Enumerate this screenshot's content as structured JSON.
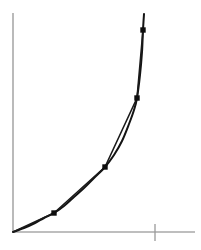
{
  "figure": {
    "width": 201,
    "height": 250,
    "background_color": "#ffffff"
  },
  "colors": {
    "axis": "#a9a9a9",
    "tick": "#9a9a9a",
    "curve": "#141414",
    "chord": "#1a1a1a",
    "marker": "#0d0d0d"
  },
  "axes": {
    "y_axis": {
      "label": "",
      "x": 13,
      "y_top": 13,
      "y_bottom": 232,
      "stroke_width": 1.6
    },
    "x_axis": {
      "label": "",
      "y": 232,
      "x_left": 13,
      "x_right": 195,
      "stroke_width": 1.6
    },
    "ticks": [
      {
        "name": "x-tick-1",
        "axis": "x",
        "x": 155,
        "y_top": 224,
        "y_bottom": 241,
        "label": ""
      }
    ]
  },
  "chart_data": {
    "type": "line",
    "title": "",
    "subtitle": "",
    "xlabel": "",
    "ylabel": "",
    "grid": false,
    "legend": null,
    "xlim": [
      13,
      195
    ],
    "ylim": [
      13,
      232
    ],
    "axis_note": "unlabeled schematic axes; values are pixel coordinates of the figure",
    "series": [
      {
        "name": "smooth-curve",
        "description": "smooth convex increasing curve drawn from the origin upward, continuing past the topmost marked point",
        "stroke": "#141414",
        "stroke_width": 2.0,
        "path_points": [
          [
            13,
            232
          ],
          [
            24,
            228
          ],
          [
            35,
            223
          ],
          [
            44,
            218
          ],
          [
            54,
            213
          ],
          [
            64,
            206
          ],
          [
            74,
            197
          ],
          [
            84,
            188
          ],
          [
            94,
            178
          ],
          [
            105,
            167
          ],
          [
            114,
            155
          ],
          [
            122,
            141
          ],
          [
            129,
            124
          ],
          [
            134,
            110
          ],
          [
            137,
            98
          ],
          [
            140,
            75
          ],
          [
            142,
            52
          ],
          [
            143,
            30
          ],
          [
            144,
            14
          ]
        ]
      },
      {
        "name": "inscribed-chord-polyline",
        "description": "straight chords connecting consecutive marked points, lying above/left of the smooth curve between markers",
        "stroke": "#1a1a1a",
        "stroke_width": 1.6,
        "path_points": [
          [
            13,
            232
          ],
          [
            54,
            213
          ],
          [
            105,
            167
          ],
          [
            137,
            98
          ],
          [
            143,
            30
          ]
        ]
      }
    ],
    "points": [
      {
        "name": "point-origin",
        "x": 13,
        "y": 232,
        "marked": false,
        "label": ""
      },
      {
        "name": "point-1",
        "x": 54,
        "y": 213,
        "marked": true,
        "label": ""
      },
      {
        "name": "point-2",
        "x": 105,
        "y": 167,
        "marked": true,
        "label": ""
      },
      {
        "name": "point-3",
        "x": 137,
        "y": 98,
        "marked": true,
        "label": ""
      },
      {
        "name": "point-4",
        "x": 143,
        "y": 30,
        "marked": true,
        "label": ""
      }
    ],
    "marker": {
      "shape": "square",
      "size": 5.4,
      "color": "#0d0d0d"
    }
  }
}
